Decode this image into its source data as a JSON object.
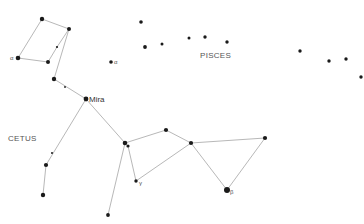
{
  "constellations": [
    {
      "name": "CETUS",
      "label_x": 8,
      "label_y": 141
    },
    {
      "name": "PISCES",
      "label_x": 200,
      "label_y": 58
    }
  ],
  "star_labels": {
    "mira": "Mira",
    "alpha_cetus": "α",
    "alpha_pisces": "α",
    "beta": "β",
    "gamma": "γ"
  },
  "stars": [
    {
      "id": "c1",
      "x": 42,
      "y": 19,
      "r": 2.2
    },
    {
      "id": "c2",
      "x": 69,
      "y": 29,
      "r": 2.0
    },
    {
      "id": "c3",
      "x": 18,
      "y": 58,
      "r": 2.3
    },
    {
      "id": "c4",
      "x": 48,
      "y": 62,
      "r": 2.0
    },
    {
      "id": "c5",
      "x": 57,
      "y": 47,
      "r": 1.1
    },
    {
      "id": "c6",
      "x": 54,
      "y": 79,
      "r": 2.2
    },
    {
      "id": "c7",
      "x": 65,
      "y": 87,
      "r": 0.9
    },
    {
      "id": "mira",
      "x": 86,
      "y": 99,
      "r": 2.4
    },
    {
      "id": "c9",
      "x": 125,
      "y": 143,
      "r": 2.3
    },
    {
      "id": "c10",
      "x": 128,
      "y": 146,
      "r": 1.6
    },
    {
      "id": "c11",
      "x": 166,
      "y": 130,
      "r": 2.1
    },
    {
      "id": "c12",
      "x": 191,
      "y": 143,
      "r": 2.1
    },
    {
      "id": "c13",
      "x": 265,
      "y": 138,
      "r": 2.1
    },
    {
      "id": "beta",
      "x": 227,
      "y": 190,
      "r": 3.0
    },
    {
      "id": "gamma",
      "x": 136,
      "y": 181,
      "r": 1.7
    },
    {
      "id": "c16",
      "x": 108,
      "y": 215,
      "r": 1.9
    },
    {
      "id": "c17",
      "x": 52,
      "y": 153,
      "r": 1.0
    },
    {
      "id": "c18",
      "x": 46,
      "y": 165,
      "r": 2.1
    },
    {
      "id": "c19",
      "x": 43,
      "y": 195,
      "r": 2.2
    },
    {
      "id": "alpha_p",
      "x": 111,
      "y": 62,
      "r": 1.8
    },
    {
      "id": "p1",
      "x": 141,
      "y": 22,
      "r": 1.8
    },
    {
      "id": "p2",
      "x": 145,
      "y": 47,
      "r": 1.9
    },
    {
      "id": "p3",
      "x": 162,
      "y": 44,
      "r": 1.5
    },
    {
      "id": "p4",
      "x": 189,
      "y": 38,
      "r": 1.5
    },
    {
      "id": "p5",
      "x": 205,
      "y": 37,
      "r": 1.7
    },
    {
      "id": "p6",
      "x": 227,
      "y": 42,
      "r": 1.7
    },
    {
      "id": "p7",
      "x": 300,
      "y": 51,
      "r": 1.7
    },
    {
      "id": "p8",
      "x": 329,
      "y": 61,
      "r": 1.7
    },
    {
      "id": "p9",
      "x": 346,
      "y": 59,
      "r": 1.7
    },
    {
      "id": "p10",
      "x": 361,
      "y": 77,
      "r": 1.7
    }
  ],
  "lines": [
    [
      "c1",
      "c2"
    ],
    [
      "c1",
      "c3"
    ],
    [
      "c3",
      "c4"
    ],
    [
      "c4",
      "c5"
    ],
    [
      "c5",
      "c2"
    ],
    [
      "c2",
      "c6"
    ],
    [
      "c6",
      "mira"
    ],
    [
      "mira",
      "c9"
    ],
    [
      "mira",
      "c18"
    ],
    [
      "c18",
      "c19"
    ],
    [
      "c9",
      "c11"
    ],
    [
      "c11",
      "c12"
    ],
    [
      "c12",
      "c13"
    ],
    [
      "c13",
      "beta"
    ],
    [
      "beta",
      "c12"
    ],
    [
      "c12",
      "gamma"
    ],
    [
      "gamma",
      "c10"
    ],
    [
      "c9",
      "c16"
    ]
  ],
  "colors": {
    "background": "#ffffff",
    "star": "#1a1a1a",
    "line": "#b8b8b8",
    "label": "#555555"
  }
}
